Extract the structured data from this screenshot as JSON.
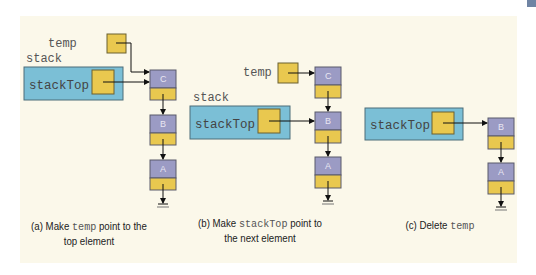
{
  "figure": {
    "colors": {
      "background": "#fbf8ea",
      "stack_box": "#7bbfd6",
      "pointer_box": "#e9c84f",
      "node_data": "#9b9bc4",
      "border": "#5a5a5a"
    },
    "panels": [
      {
        "id": "a",
        "stack_label": "stack",
        "pointer_label": "stackTop",
        "temp_label": "temp",
        "nodes": [
          "C",
          "B",
          "A"
        ],
        "caption": {
          "prefix": "(a) Make ",
          "code": "temp",
          "suffix": " point to the",
          "line2": "top element"
        }
      },
      {
        "id": "b",
        "stack_label": "stack",
        "pointer_label": "stackTop",
        "temp_label": "temp",
        "nodes": [
          "C",
          "B",
          "A"
        ],
        "caption": {
          "prefix": "(b) Make ",
          "code": "stackTop",
          "suffix": " point to",
          "line2": "the next element"
        }
      },
      {
        "id": "c",
        "pointer_label": "stackTop",
        "nodes": [
          "B",
          "A"
        ],
        "caption": {
          "prefix": "(c) Delete ",
          "code": "temp",
          "suffix": "",
          "line2": ""
        }
      }
    ]
  }
}
